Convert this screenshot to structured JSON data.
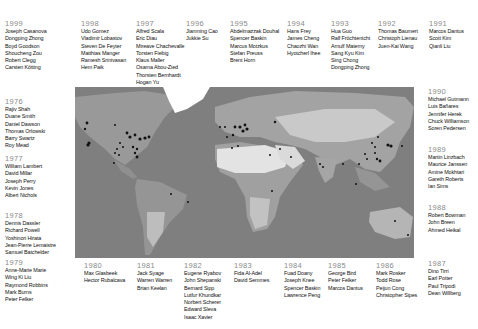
{
  "groups": [
    {
      "year": "1999",
      "x": 5,
      "y": 20,
      "names": [
        "Joseph Casanova",
        "Dongping Zhong",
        "Boyd Goodson",
        "Shoucheng Zou",
        "Robert Clegg",
        "Carsten Kötting"
      ]
    },
    {
      "year": "1998",
      "x": 81,
      "y": 20,
      "names": [
        "Udo Gomez",
        "Vladimir Lobastov",
        "Steven De Feyter",
        "Matthias Manger",
        "Ramesh Srinivasan",
        "Hem Paik"
      ]
    },
    {
      "year": "1997",
      "x": 136,
      "y": 20,
      "names": [
        "Alfred Scala",
        "Eric Diau",
        "Mireave Chachevalle",
        "Torsten Fiebig",
        "Klaus Maller",
        "Osama Abou-Zied",
        "Thorsten Bernhardt",
        "Hogan Yu"
      ]
    },
    {
      "year": "1996",
      "x": 186,
      "y": 20,
      "names": [
        "Jianming Cao",
        "Jukkie Su"
      ]
    },
    {
      "year": "1995",
      "x": 230,
      "y": 20,
      "names": [
        "Abdelmazzak Douhal",
        "Spencer Baskin",
        "Marcus Motzkus",
        "Stefan Preuss",
        "Brent Horn"
      ]
    },
    {
      "year": "1994",
      "x": 287,
      "y": 20,
      "names": [
        "Hans Frey",
        "James Cheng",
        "Chaozhi Wan",
        "Hyotcherl Ihee"
      ]
    },
    {
      "year": "1993",
      "x": 331,
      "y": 20,
      "names": [
        "Hua Guo",
        "Ralf Fröchtenicht",
        "Arnulf Materny",
        "Sang Kyu Kim",
        "Sing Chong",
        "Dongping Zhong"
      ]
    },
    {
      "year": "1992",
      "x": 378,
      "y": 20,
      "names": [
        "Thomas Baumert",
        "Christoph Lienau",
        "Juen-Kai Wang"
      ]
    },
    {
      "year": "1991",
      "x": 429,
      "y": 20,
      "names": [
        "Marcos Dantus",
        "Scott Kim",
        "Qianli Liu"
      ]
    },
    {
      "year": "1990",
      "x": 428,
      "y": 88,
      "names": [
        "Michael Gutmann",
        "Luis Bañares",
        "Jennifer Herek",
        "Chuck Williamson",
        "Soren Pedersen"
      ]
    },
    {
      "year": "1989",
      "x": 428,
      "y": 146,
      "names": [
        "Martin Linzbach",
        "Maurice Janssen",
        "Amine Mokhtari",
        "Gareth Roberts",
        "Ian Sims"
      ]
    },
    {
      "year": "1988",
      "x": 428,
      "y": 204,
      "names": [
        "Robert Bowman",
        "John Breen",
        "Ahmed Heikal"
      ]
    },
    {
      "year": "1987",
      "x": 428,
      "y": 260,
      "names": [
        "Dino Tirri",
        "Earl Potter",
        "Paul Tripodi",
        "Dean Willberg"
      ]
    },
    {
      "year": "1976",
      "x": 5,
      "y": 98,
      "names": [
        "Rajiv Shah",
        "Duane Smith",
        "Daniel Dawson",
        "Thomas Orlowski",
        "Barry Swartz",
        "Roy Mead"
      ]
    },
    {
      "year": "1977",
      "x": 5,
      "y": 155,
      "names": [
        "William Lambert",
        "David Millar",
        "Joseph Perry",
        "Kevin Jones",
        "Albert Nichols"
      ]
    },
    {
      "year": "1978",
      "x": 5,
      "y": 212,
      "names": [
        "Dennis Dassler",
        "Richard Powell",
        "Yoshinori Hirata",
        "Jean-Pierre Lemaistre",
        "Samuel Batchelder"
      ]
    },
    {
      "year": "1979",
      "x": 5,
      "y": 259,
      "names": [
        "Anne-Marie Marie",
        "Wing Ki Liu",
        "Raymond Robbins",
        "Mark Burns",
        "Peter Felker"
      ]
    },
    {
      "year": "1980",
      "x": 84,
      "y": 262,
      "names": [
        "Max Glasbeek",
        "Hector Rubalcava"
      ]
    },
    {
      "year": "1981",
      "x": 137,
      "y": 262,
      "names": [
        "Jack Syage",
        "Warren Warren",
        "Brian Keelan"
      ]
    },
    {
      "year": "1982",
      "x": 184,
      "y": 262,
      "names": [
        "Eugene Ryabov",
        "John Shepanski",
        "Bernard Sipp",
        "Lutfur Khundkar",
        "Norbert Scherer",
        "Edward Sleva",
        "Isaac Xavier"
      ]
    },
    {
      "year": "1983",
      "x": 234,
      "y": 262,
      "names": [
        "Fida Al-Adel",
        "David Semmes"
      ]
    },
    {
      "year": "1984",
      "x": 284,
      "y": 262,
      "names": [
        "Fuad Doany",
        "Joseph Knee",
        "Spencer Baskin",
        "Lawrence Peng"
      ]
    },
    {
      "year": "1985",
      "x": 328,
      "y": 262,
      "names": [
        "George Bird",
        "Peter Felker",
        "Marcos Dantus"
      ]
    },
    {
      "year": "1986",
      "x": 376,
      "y": 262,
      "names": [
        "Mark Rosker",
        "Todd Rose",
        "Peijun Cong",
        "Christopher Sipes"
      ]
    }
  ],
  "map": {
    "background": "#7d7d7d",
    "land": "#9a9a9a",
    "desert": "#dcdcdc",
    "dot_color": "#111111"
  }
}
